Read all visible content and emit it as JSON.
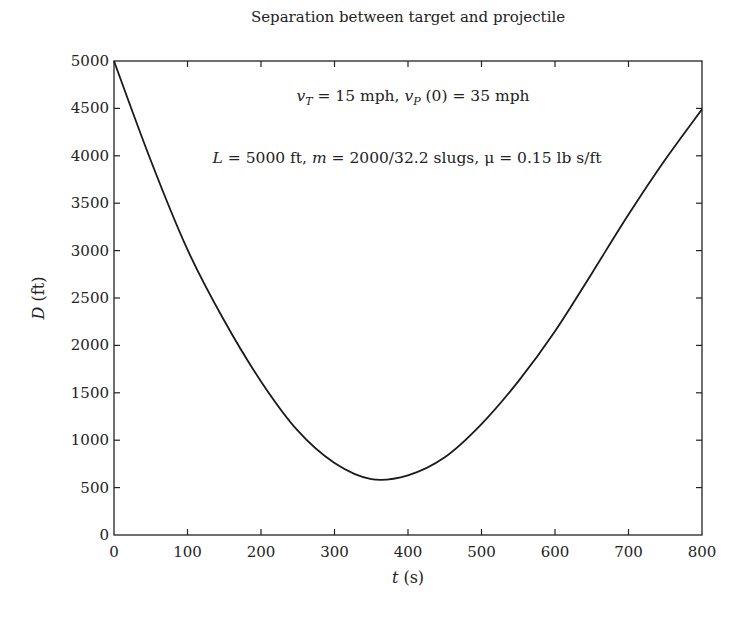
{
  "chart_data": {
    "type": "line",
    "title": "Separation between target and projectile",
    "xlabel": "t (s)",
    "xlabel_var": "t",
    "xlabel_unit": " (s)",
    "ylabel": "D (ft)",
    "ylabel_var": "D",
    "ylabel_unit": " (ft)",
    "xlim": [
      0,
      800
    ],
    "ylim": [
      0,
      5000
    ],
    "grid": false,
    "legend": null,
    "x_ticks": [
      0,
      100,
      200,
      300,
      400,
      500,
      600,
      700,
      800
    ],
    "y_ticks": [
      0,
      500,
      1000,
      1500,
      2000,
      2500,
      3000,
      3500,
      4000,
      4500,
      5000
    ],
    "annotations": [
      "vT = 15 mph, vP(0) = 35 mph",
      "L = 5000 ft, m = 2000/32.2 slugs, μ = 0.15 lb s/ft"
    ],
    "series": [
      {
        "name": "D(t)",
        "color": "#1a1a1a",
        "x": [
          0,
          50,
          100,
          150,
          200,
          250,
          300,
          350,
          400,
          450,
          500,
          550,
          600,
          650,
          700,
          750,
          800
        ],
        "values": [
          5000,
          3950,
          3010,
          2260,
          1620,
          1100,
          760,
          590,
          630,
          820,
          1170,
          1620,
          2150,
          2760,
          3380,
          3960,
          4490
        ]
      }
    ]
  },
  "annotation_line1": {
    "v1": "v",
    "s1": "T",
    "t1": " = 15 mph, ",
    "v2": "v",
    "s2": "P",
    "t2": " (0) = 35 mph"
  },
  "annotation_line2": {
    "v1": "L",
    "t1": " = 5000 ft, ",
    "v2": "m",
    "t2": " = 2000/32.2 slugs, μ = 0.15 lb s/ft"
  }
}
